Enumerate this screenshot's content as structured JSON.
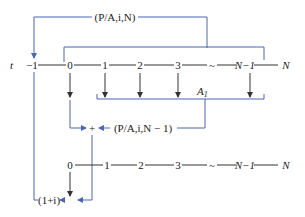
{
  "colors": {
    "bracket": "#4a67b5",
    "timeline": "#333333",
    "arrow": "#333333",
    "background": "#ffffff"
  },
  "labels": {
    "top_factor": "(P/A,i,N)",
    "mid_factor": "(P/A,i,N − 1)",
    "annuity": "A",
    "annuity_sub": "1",
    "compound": "(1+i)",
    "plus": "+",
    "t_label": "t"
  },
  "timeline_top": {
    "ticks": [
      "−1",
      "0",
      "1",
      "2",
      "3",
      "~",
      "N−1",
      "N"
    ]
  },
  "timeline_bottom": {
    "ticks": [
      "0",
      "1",
      "2",
      "3",
      "~",
      "N−1",
      "N"
    ]
  }
}
